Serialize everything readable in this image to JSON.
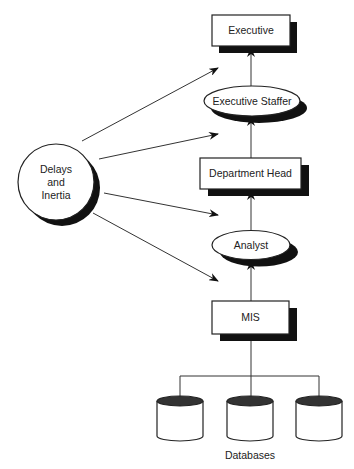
{
  "diagram": {
    "hierarchy": [
      {
        "id": "executive",
        "label": "Executive",
        "shape": "box"
      },
      {
        "id": "executive-staffer",
        "label": "Executive Staffer",
        "shape": "ellipse"
      },
      {
        "id": "department-head",
        "label": "Department Head",
        "shape": "box"
      },
      {
        "id": "analyst",
        "label": "Analyst",
        "shape": "ellipse"
      },
      {
        "id": "mis",
        "label": "MIS",
        "shape": "box"
      }
    ],
    "influence": {
      "label_line1": "Delays",
      "label_line2": "and",
      "label_line3": "Inertia",
      "shape": "circle",
      "arrows_to": [
        "executive-staffer/executive gap",
        "department-head/executive-staffer gap",
        "analyst/department-head gap",
        "mis/analyst gap"
      ]
    },
    "databases": {
      "label": "Databases",
      "count": 3
    },
    "colors": {
      "stroke": "#222222",
      "shadow": "#111111",
      "db_top": "#333333",
      "background": "#ffffff"
    }
  }
}
